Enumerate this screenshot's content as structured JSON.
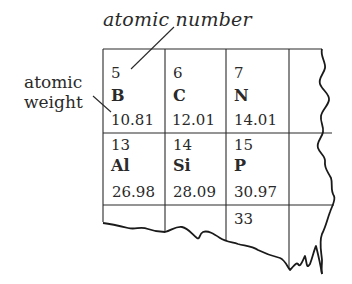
{
  "labels": {
    "atomic_number": "atomic number",
    "atomic_weight_line1": "atomic",
    "atomic_weight_line2": "weight"
  },
  "grid": {
    "rows": [
      [
        {
          "number": "5",
          "symbol": "B",
          "weight": "10.81"
        },
        {
          "number": "6",
          "symbol": "C",
          "weight": "12.01"
        },
        {
          "number": "7",
          "symbol": "N",
          "weight": "14.01"
        }
      ],
      [
        {
          "number": "13",
          "symbol": "Al",
          "weight": "26.98"
        },
        {
          "number": "14",
          "symbol": "Si",
          "weight": "28.09"
        },
        {
          "number": "15",
          "symbol": "P",
          "weight": "30.97"
        }
      ],
      [
        {
          "number": "",
          "symbol": "",
          "weight": ""
        },
        {
          "number": "",
          "symbol": "",
          "weight": ""
        },
        {
          "number": "33",
          "symbol": "",
          "weight": ""
        }
      ]
    ]
  },
  "colors": {
    "ink": "#2a2a2a",
    "background": "#ffffff"
  }
}
